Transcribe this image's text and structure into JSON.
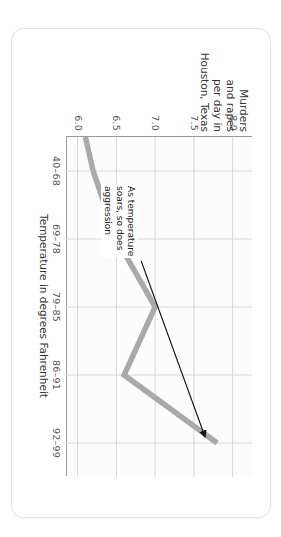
{
  "chart_data": {
    "type": "line",
    "title": "",
    "subtitle": "",
    "xlabel": "Temperature in degrees Fahrenheit",
    "ylabel": "Murders and rapes per day in Houston, Texas",
    "categories": [
      "40–68",
      "69–78",
      "79–85",
      "86–91",
      "92–99"
    ],
    "values": [
      6.2,
      6.5,
      7.0,
      6.6,
      7.8
    ],
    "ylim": [
      5.85,
      8.25
    ],
    "yticks": [
      "6.0",
      "6.5",
      "7.0",
      "7.5",
      "8.0"
    ],
    "ytick_values": [
      6.0,
      6.5,
      7.0,
      7.5,
      8.0
    ],
    "grid": true,
    "legend": "none",
    "series": [
      {
        "name": "Murders and rapes per day in Houston, Texas",
        "values": [
          6.2,
          6.5,
          7.0,
          6.6,
          7.8
        ],
        "color": "#a9a9a9"
      }
    ],
    "annotations": [
      {
        "text_lines": [
          "As temperature",
          "soars, so does",
          "aggression"
        ],
        "points_to_category": "92–99",
        "arrow": "arrow-annotation"
      }
    ],
    "colors": {
      "line": "#a9a9a9",
      "grid": "#d8d8d8",
      "axis": "#9a9a9a",
      "text": "#333333",
      "tick_text": "#555555",
      "card_background": "#ffffff",
      "plot_background": "#fcfcfc",
      "page_background": "#ffffff",
      "annotation_text": "#1b1b1b"
    },
    "axis_titles": {
      "x": "Temperature in degrees Fahrenheit",
      "y_lines": [
        "Murders",
        "and rapes",
        "per day in",
        "Houston, Texas"
      ]
    }
  }
}
